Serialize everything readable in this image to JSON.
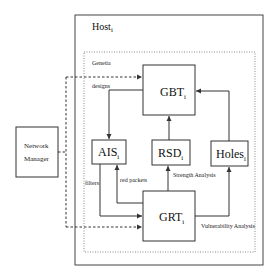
{
  "diagram": {
    "host": {
      "label": "Host",
      "subscript": "i"
    },
    "generic": {
      "label": "Genetia"
    },
    "nodes": {
      "gbt": {
        "label": "GBT",
        "subscript": "i"
      },
      "ais": {
        "label": "AIS",
        "subscript": "i"
      },
      "rsd": {
        "label": "RSD",
        "subscript": "i"
      },
      "holes": {
        "label": "Holes",
        "subscript": "i"
      },
      "grt": {
        "label": "GRT",
        "subscript": "i"
      },
      "network_manager": {
        "line1": "Network",
        "line2": "Manager"
      }
    },
    "edges": {
      "designs": "designs",
      "filters": "filters",
      "red_packets": "red packets",
      "strength_analysis": "Strength Analysis",
      "vulnerability_analysis": "Vulnerability Analysis"
    }
  }
}
